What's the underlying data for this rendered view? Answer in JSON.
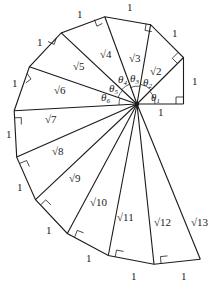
{
  "diagram": {
    "center": [
      137,
      104
    ],
    "unit_px": 46.5,
    "side_label": "1",
    "hypotenuse_labels": [
      "√2",
      "√3",
      "√4",
      "√5",
      "√6",
      "√7",
      "√8",
      "√9",
      "√10",
      "√11",
      "√12",
      "√13"
    ],
    "angle_labels": [
      "θ1",
      "θ2",
      "θ3",
      "θ4",
      "θ5",
      "θ6"
    ],
    "angle_symbol": "θ",
    "angle_subscripts": [
      "1",
      "2",
      "3",
      "4",
      "5",
      "6"
    ],
    "outer_side_labels": [
      "1",
      "1",
      "1",
      "1",
      "1",
      "1",
      "1",
      "1",
      "1",
      "1",
      "1",
      "1",
      "1"
    ],
    "colors": {
      "line": "#1a1a1a",
      "background": "#ffffff"
    }
  }
}
